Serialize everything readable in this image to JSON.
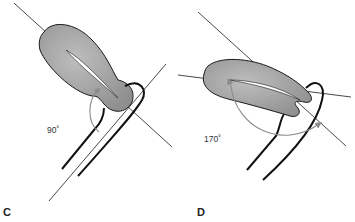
{
  "panels": [
    {
      "id": "C",
      "label": "C",
      "angle_label": "90˚",
      "angle_value": 90
    },
    {
      "id": "D",
      "label": "D",
      "angle_label": "170˚",
      "angle_value": 170
    }
  ],
  "colors": {
    "organ_fill": "#a8a8a8",
    "organ_stroke": "#1a1a1a",
    "arrow": "#8c8c8c",
    "axis_line": "#1a1a1a"
  }
}
